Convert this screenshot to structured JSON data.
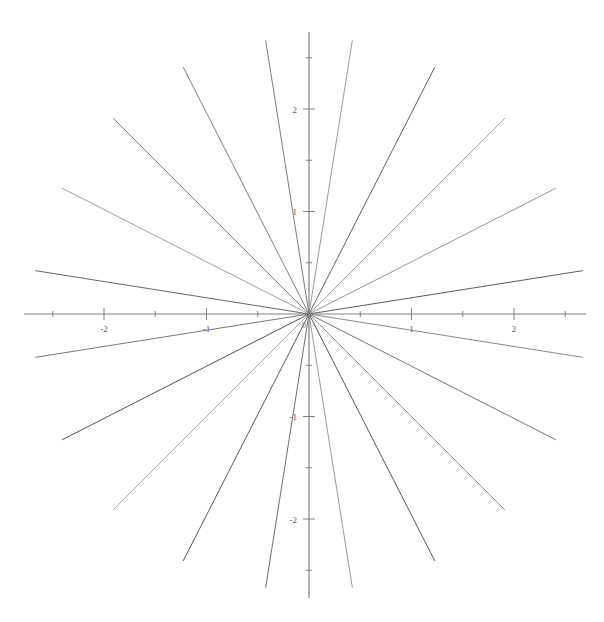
{
  "chart_data": {
    "type": "line",
    "title": "",
    "subtitle": "",
    "xlabel": "",
    "ylabel": "",
    "grid": false,
    "legend": null,
    "legend_position": "none",
    "xlim": [
      -2.75,
      2.75
    ],
    "ylim": [
      -2.85,
      2.85
    ],
    "axis_style": "crossed-at-origin",
    "x_major_ticks": [
      -2,
      -1,
      1,
      2
    ],
    "x_major_tick_labels": [
      "-2",
      "-1",
      "1",
      "2"
    ],
    "x_minor_ticks": [
      -2.5,
      -1.5,
      -0.5,
      0.5,
      1.5,
      2.5
    ],
    "y_major_ticks": [
      -2,
      -1,
      1,
      2
    ],
    "y_major_tick_labels": [
      "-2",
      "-1",
      "1",
      "2"
    ],
    "y_minor_ticks": [
      -2.5,
      -1.5,
      -0.5,
      0.5,
      1.5,
      2.5
    ],
    "origin_label": "0",
    "ray_count": 20,
    "ray_angle_step_deg": 18,
    "ray_angle_offset_deg": 9,
    "ray_radius": 2.7,
    "rays": [
      {
        "index": 0,
        "angle_deg": 9,
        "radius": 2.7,
        "x_end": 2.667,
        "y_end": 0.422,
        "color": "#4a4a4a"
      },
      {
        "index": 1,
        "angle_deg": 27,
        "radius": 2.7,
        "x_end": 2.406,
        "y_end": 1.226,
        "color": "#8a8a8a"
      },
      {
        "index": 2,
        "angle_deg": 45,
        "radius": 2.7,
        "x_end": 1.909,
        "y_end": 1.909,
        "color": "#9c9c9c"
      },
      {
        "index": 3,
        "angle_deg": 63,
        "radius": 2.7,
        "x_end": 1.226,
        "y_end": 2.406,
        "color": "#4f4f4f"
      },
      {
        "index": 4,
        "angle_deg": 81,
        "radius": 2.7,
        "x_end": 0.422,
        "y_end": 2.667,
        "color": "#8e8e8e"
      },
      {
        "index": 5,
        "angle_deg": 99,
        "radius": 2.7,
        "x_end": -0.422,
        "y_end": 2.667,
        "color": "#6e6e6e"
      },
      {
        "index": 6,
        "angle_deg": 117,
        "radius": 2.7,
        "x_end": -1.226,
        "y_end": 2.406,
        "color": "#707070"
      },
      {
        "index": 7,
        "angle_deg": 135,
        "radius": 2.7,
        "x_end": -1.909,
        "y_end": 1.909,
        "color": "#7d7d7d"
      },
      {
        "index": 8,
        "angle_deg": 153,
        "radius": 2.7,
        "x_end": -2.406,
        "y_end": 1.226,
        "color": "#959595"
      },
      {
        "index": 9,
        "angle_deg": 171,
        "radius": 2.7,
        "x_end": -2.667,
        "y_end": 0.422,
        "color": "#555555"
      },
      {
        "index": 10,
        "angle_deg": 189,
        "radius": 2.7,
        "x_end": -2.667,
        "y_end": -0.422,
        "color": "#6a6a6a"
      },
      {
        "index": 11,
        "angle_deg": 207,
        "radius": 2.7,
        "x_end": -2.406,
        "y_end": -1.226,
        "color": "#3f3f3f"
      },
      {
        "index": 12,
        "angle_deg": 225,
        "radius": 2.7,
        "x_end": -1.909,
        "y_end": -1.909,
        "color": "#a2a2a2"
      },
      {
        "index": 13,
        "angle_deg": 243,
        "radius": 2.7,
        "x_end": -1.226,
        "y_end": -2.406,
        "color": "#4a4a4a"
      },
      {
        "index": 14,
        "angle_deg": 261,
        "radius": 2.7,
        "x_end": -0.422,
        "y_end": -2.667,
        "color": "#5e5e5e"
      },
      {
        "index": 15,
        "angle_deg": 279,
        "radius": 2.7,
        "x_end": 0.422,
        "y_end": -2.667,
        "color": "#8f8f8f"
      },
      {
        "index": 16,
        "angle_deg": 297,
        "radius": 2.7,
        "x_end": 1.226,
        "y_end": -2.406,
        "color": "#454545"
      },
      {
        "index": 17,
        "angle_deg": 315,
        "radius": 2.7,
        "x_end": 1.909,
        "y_end": -1.909,
        "color": "#8b8b8b"
      },
      {
        "index": 18,
        "angle_deg": 333,
        "radius": 2.7,
        "x_end": 2.406,
        "y_end": -1.226,
        "color": "#666666"
      },
      {
        "index": 19,
        "angle_deg": 351,
        "radius": 2.7,
        "x_end": 2.667,
        "y_end": -0.422,
        "color": "#7a7a7a"
      }
    ],
    "colors": {
      "background": "#ffffff",
      "axis": "#808080",
      "tick_label": "#5a5a5a",
      "ray_default": "#707070"
    }
  },
  "geometry": {
    "origin_px": {
      "x": 309,
      "y": 314
    },
    "unit_px": 102.5,
    "x_axis_extent_px": {
      "left": 24,
      "right": 586
    },
    "y_axis_extent_px": {
      "top": 32,
      "bottom": 598
    },
    "major_tick_len_px": 6,
    "minor_tick_len_px": 3
  }
}
